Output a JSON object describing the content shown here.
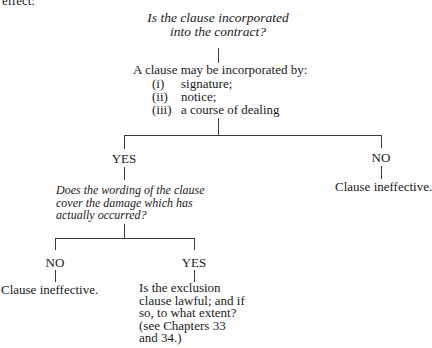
{
  "header_fragment": "effect:",
  "root": {
    "question_lines": [
      "Is the clause incorporated",
      "into the contract?"
    ],
    "incorporation": {
      "intro": "A clause may be incorporated by:",
      "items": [
        {
          "num": "(i)",
          "text": "signature;"
        },
        {
          "num": "(ii)",
          "text": "notice;"
        },
        {
          "num": "(iii)",
          "text": "a course of dealing"
        }
      ]
    }
  },
  "branch_yes": {
    "label": "YES",
    "question_lines": [
      "Does the wording of the clause",
      "cover the damage which has",
      "actually occurred?"
    ],
    "branch_no": {
      "label": "NO",
      "outcome": "Clause ineffective."
    },
    "branch_yes": {
      "label": "YES",
      "outcome_lines": [
        "Is the exclusion",
        "clause lawful; and if",
        "so, to what extent?",
        "(see Chapters 33",
        "and 34.)"
      ]
    }
  },
  "branch_no": {
    "label": "NO",
    "outcome": "Clause ineffective."
  }
}
